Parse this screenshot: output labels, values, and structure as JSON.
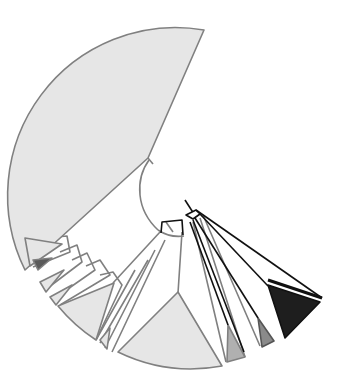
{
  "diagram": {
    "type": "radial-phylogenetic-tree",
    "colors": {
      "background": "#ffffff",
      "grey_stroke": "#808080",
      "black_stroke": "#111111",
      "light_fill": "#e6e6e6",
      "mid_fill": "#b0b0b0",
      "darkmid_fill": "#8a8a8a",
      "dark_fill": "#1e1e1e"
    },
    "center": [
      188,
      205
    ],
    "outer_radius": 168,
    "grey_polygons": [
      {
        "name": "clade-large-top",
        "fill": "light_fill",
        "points": "204,30 150,160 25,270 23,230 28,170 60,100 120,50 170,32"
      },
      {
        "name": "clade-left-1",
        "fill": "light_fill",
        "points": "25,238 60,243 30,268"
      },
      {
        "name": "clade-left-2",
        "fill": "darkmid_fill",
        "points": "33,260 50,260 37,270"
      },
      {
        "name": "clade-left-3",
        "fill": "light_fill",
        "points": "40,285 62,270 45,292"
      },
      {
        "name": "clade-left-4",
        "fill": "light_fill",
        "points": "48,298 70,285 55,305"
      },
      {
        "name": "clade-mid-left",
        "fill": "light_fill",
        "points": "58,305 115,283 95,340"
      },
      {
        "name": "clade-bottom-small",
        "fill": "light_fill",
        "points": "99,338 111,330 106,350"
      },
      {
        "name": "clade-bottom-large",
        "fill": "light_fill",
        "points": "119,352 178,293 222,366 175,370 140,362"
      },
      {
        "name": "clade-grey-1",
        "fill": "mid_fill",
        "points": "228,326 245,357 226,362"
      },
      {
        "name": "clade-grey-2",
        "fill": "darkmid_fill",
        "points": "259,320 273,341 262,346"
      },
      {
        "name": "clade-black",
        "fill": "dark_fill",
        "points": "268,285 320,307 285,338"
      }
    ]
  }
}
